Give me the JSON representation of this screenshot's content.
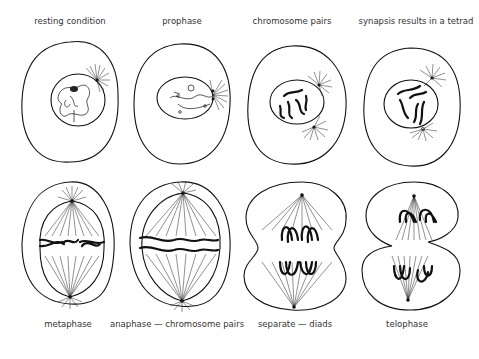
{
  "diagram": {
    "top_row": [
      {
        "id": "resting",
        "label": "resting condition",
        "x": 70,
        "y": 22
      },
      {
        "id": "prophase",
        "label": "prophase",
        "x": 182,
        "y": 22
      },
      {
        "id": "chromosome_pairs",
        "label": "chromosome pairs",
        "x": 292,
        "y": 22
      },
      {
        "id": "synapsis",
        "label": "synapsis results in a tetrad",
        "x": 416,
        "y": 22
      }
    ],
    "bottom_row": [
      {
        "id": "metaphase",
        "label": "metaphase",
        "x": 68,
        "y": 322
      },
      {
        "id": "anaphase",
        "label": "anaphase — chromosome pairs",
        "x": 177,
        "y": 322
      },
      {
        "id": "separate",
        "label": "separate — diads",
        "x": 295,
        "y": 322
      },
      {
        "id": "telophase",
        "label": "telophase",
        "x": 407,
        "y": 322
      }
    ]
  }
}
